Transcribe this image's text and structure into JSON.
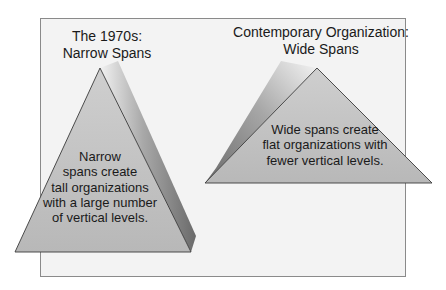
{
  "diagram": {
    "colors": {
      "background": "#ffffff",
      "panel_fill": "#f3f3f3",
      "panel_border": "#8a8a8a",
      "triangle_fill": "#bdbdbd",
      "triangle_stroke": "#3a3a3a",
      "shadow_dark": "#6e6e6e",
      "shadow_light": "#f0f0f0",
      "text": "#1a1a1a"
    },
    "left": {
      "title_line1": "The 1970s:",
      "title_line2": "Narrow Spans",
      "body": [
        "Narrow",
        "spans create",
        "tall organizations",
        "with a large number",
        "of vertical levels."
      ]
    },
    "right": {
      "title_line1": "Contemporary Organization:",
      "title_line2": "Wide Spans",
      "body": [
        "Wide spans create",
        "flat organizations with",
        "fewer vertical levels."
      ]
    }
  }
}
